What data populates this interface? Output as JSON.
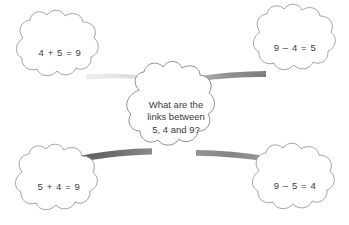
{
  "diagram": {
    "background_color": "#ffffff",
    "text_color": "#3a3a3c",
    "outline_color": "#8c8c8e",
    "center": {
      "id": "center-question",
      "lines": [
        "What are the",
        "links between",
        "5, 4 and 9?"
      ]
    },
    "nodes": [
      {
        "id": "top-left",
        "equation": "4 + 5 = 9",
        "position": "top-left"
      },
      {
        "id": "top-right",
        "equation": "9 – 4 = 5",
        "position": "top-right"
      },
      {
        "id": "bottom-left",
        "equation": "5 + 4 = 9",
        "position": "bottom-left"
      },
      {
        "id": "bottom-right",
        "equation": "9 – 5 = 4",
        "position": "bottom-right"
      }
    ],
    "connectors": [
      {
        "id": "connector-top-left",
        "from": "top-left",
        "to": "center-question",
        "color": "#e3e3e3"
      },
      {
        "id": "connector-top-right",
        "from": "center-question",
        "to": "top-right",
        "color": "#9a9a9a"
      },
      {
        "id": "connector-bottom-left",
        "from": "bottom-left",
        "to": "center-question",
        "color": "#6b6b6b"
      },
      {
        "id": "connector-bottom-right",
        "from": "center-question",
        "to": "bottom-right",
        "color": "#8a8a8a"
      }
    ]
  }
}
